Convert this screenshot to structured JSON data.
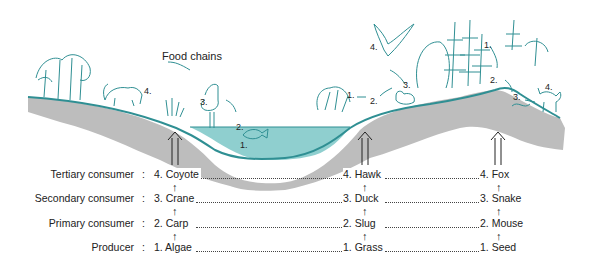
{
  "title": "Food chains",
  "levels": [
    {
      "name": "Tertiary consumer",
      "y": 199
    },
    {
      "name": "Secondary consumer",
      "y": 222
    },
    {
      "name": "Primary consumer",
      "y": 245
    },
    {
      "name": "Producer",
      "y": 268
    }
  ],
  "chains": [
    {
      "habitat": "pond",
      "items": [
        "4. Coyote",
        "3. Crane",
        "2. Carp",
        "1. Algae"
      ]
    },
    {
      "habitat": "grassland",
      "items": [
        "4. Hawk",
        "3. Duck",
        "2. Slug",
        "1. Grass"
      ]
    },
    {
      "habitat": "forest",
      "items": [
        "4. Fox",
        "3. Snake",
        "2. Mouse",
        "1. Seed"
      ]
    }
  ],
  "scene_numbers": {
    "pond": [
      "1.",
      "2.",
      "3.",
      "4."
    ],
    "grassland": [
      "1.",
      "2.",
      "3.",
      "4."
    ],
    "forest": [
      "1.",
      "2.",
      "3.",
      "4."
    ]
  },
  "colors": {
    "teal": "#2f8f93",
    "water": "#8fcfcf",
    "ground": "#bdbdbd",
    "text": "#222222"
  }
}
